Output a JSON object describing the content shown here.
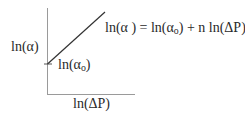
{
  "diagram": {
    "type": "log-log plot schematic",
    "y_axis_label": {
      "base": "ln(α",
      "close": ")"
    },
    "x_axis_label": "ln(ΔP)",
    "intercept_label": {
      "pre": "ln(α",
      "sub": "o",
      "post": ")"
    },
    "equation": {
      "lhs": "ln(α ) = ln(α",
      "sub": "o",
      "rhs": ") + n ln(ΔP)"
    },
    "colors": {
      "axis": "#9a9a9a",
      "line": "#333333",
      "text": "#2a2a2a"
    }
  }
}
